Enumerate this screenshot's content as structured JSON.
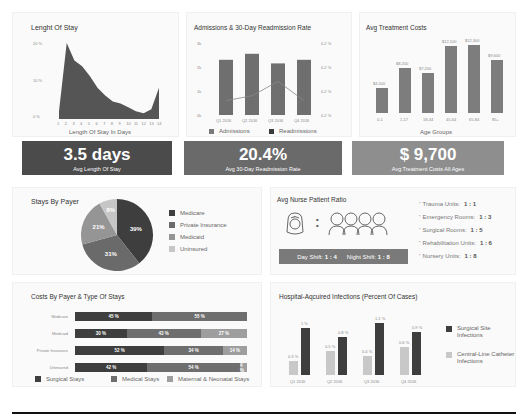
{
  "colors": {
    "dark": "#4a4a4a",
    "mid": "#6e6e6e",
    "light": "#9a9a9a",
    "lighter": "#c4c4c4",
    "bar": "#7d7d7d"
  },
  "length_of_stay": {
    "title": "Lenght Of Stay",
    "xlabel": "Length Of Stay In Days",
    "yticks": [
      "20 %",
      "10 %",
      "0 %"
    ],
    "xticks": [
      "1",
      "2",
      "3",
      "4",
      "5",
      "6",
      "7",
      "8",
      "9",
      "10",
      "11",
      "12",
      "13",
      "14"
    ]
  },
  "admissions": {
    "title": "Admissions & 30-Day Readmission Rate",
    "yticks_left": [
      "3k",
      "2k",
      "1k",
      "0k"
    ],
    "yticks_right": [
      "0.2 %",
      "0.2 %",
      "0.2 %",
      "0.2 %"
    ],
    "xticks": [
      "Q1 2016",
      "Q2 2016",
      "Q3 2016",
      "Q4 2016"
    ],
    "legend": [
      "Admissions",
      "Readmissions"
    ]
  },
  "treatment_costs": {
    "title": "Avg Treatment Costs",
    "xlabel": "Age Groups",
    "labels": [
      "$4,500",
      "$8,200",
      "$7,200",
      "$12,100",
      "$12,300",
      "$9,600"
    ],
    "xticks": [
      "0-1",
      "1-17",
      "18-44",
      "45-64",
      "65-84",
      "85+"
    ]
  },
  "kpis": [
    {
      "value": "3.5 days",
      "label": "Avg Length Of Stay",
      "color": "#4b4b4b"
    },
    {
      "value": "20.4%",
      "label": "Avg 30-Day Readmission Rate",
      "color": "#6a6a6a"
    },
    {
      "value": "$ 9,700",
      "label": "Avg Treatment Costs All Ages",
      "color": "#8e8e8e"
    }
  ],
  "stays_by_payer": {
    "title": "Stays By Payer",
    "slices": [
      {
        "label": "Medicare",
        "pct": "39%"
      },
      {
        "label": "Private Insurance",
        "pct": "31%"
      },
      {
        "label": "Medicaid",
        "pct": "21%"
      },
      {
        "label": "Uninsured",
        "pct": "8%"
      }
    ]
  },
  "nurse_ratio": {
    "title": "Avg Nurse Patient Ratio",
    "colon": ":",
    "day_shift_label": "Day Shift:",
    "day_shift_value": "1 : 4",
    "night_shift_label": "Night Shift:",
    "night_shift_value": "1 : 8",
    "units": [
      {
        "label": "Trauma Units:",
        "value": "1 : 1"
      },
      {
        "label": "Emergency Rooms:",
        "value": "1 : 3"
      },
      {
        "label": "Surgical Rooms:",
        "value": "1 : 5"
      },
      {
        "label": "Rehabilitation Units:",
        "value": "1 : 6"
      },
      {
        "label": "Nursery Units:",
        "value": "1 : 8"
      }
    ]
  },
  "costs_by_payer": {
    "title": "Costs By Payer & Type Of Stays",
    "rows": [
      {
        "label": "Medicare",
        "segments": [
          "45 %",
          "55 %"
        ]
      },
      {
        "label": "Medicaid",
        "segments": [
          "30 %",
          "43 %",
          "27 %"
        ]
      },
      {
        "label": "Private Insurance",
        "segments": [
          "52 %",
          "34 %",
          "14 %"
        ]
      },
      {
        "label": "Uninsured",
        "segments": [
          "42 %",
          "54 %",
          "4 %"
        ]
      }
    ],
    "legend": [
      "Surgical Stays",
      "Medical Stays",
      "Maternal & Neonatal Stays"
    ]
  },
  "infections": {
    "title": "Hospital-Aqcuired Infections (Percent Of Cases)",
    "xticks": [
      "Q1 2016",
      "Q2 2016",
      "Q3 2016",
      "Q4 2016"
    ],
    "central_line_labels": [
      "0.3 %",
      "0.5 %",
      "0.4 %",
      "0.6 %"
    ],
    "surgical_labels": [
      "1 %",
      "0.8 %",
      "1.1 %",
      "0.9 %"
    ],
    "legend": [
      "Surgical Site Infections",
      "Central-Line Catheter Infections"
    ]
  },
  "chart_data": [
    {
      "type": "area",
      "title": "Lenght Of Stay",
      "xlabel": "Length Of Stay In Days",
      "ylabel": "",
      "x": [
        1,
        2,
        3,
        4,
        5,
        6,
        7,
        8,
        9,
        10,
        11,
        12,
        13,
        14
      ],
      "values": [
        2,
        19.5,
        15,
        13.5,
        11,
        8,
        6,
        4.5,
        4,
        3,
        2,
        1.5,
        2.5,
        8
      ],
      "ylim": [
        0,
        20
      ],
      "yticks": [
        "0 %",
        "10 %",
        "20 %"
      ]
    },
    {
      "type": "bar",
      "title": "Admissions & 30-Day Readmission Rate",
      "categories": [
        "Q1 2016",
        "Q2 2016",
        "Q3 2016",
        "Q4 2016"
      ],
      "series": [
        {
          "name": "Admissions",
          "type": "bar",
          "values": [
            2300,
            2550,
            2150,
            2300
          ]
        },
        {
          "name": "Readmissions",
          "type": "line",
          "values": [
            0.196,
            0.198,
            0.204,
            0.196
          ]
        }
      ],
      "ylim": [
        0,
        3000
      ],
      "yticks_left": [
        "0k",
        "1k",
        "2k",
        "3k"
      ],
      "yticks_right": [
        "0.2 %",
        "0.2 %",
        "0.2 %",
        "0.2 %"
      ]
    },
    {
      "type": "bar",
      "title": "Avg Treatment Costs",
      "xlabel": "Age Groups",
      "categories": [
        "0-1",
        "1-17",
        "18-44",
        "45-64",
        "65-84",
        "85+"
      ],
      "values": [
        4500,
        8200,
        7200,
        12100,
        12300,
        9600
      ],
      "ylim": [
        0,
        13000
      ]
    },
    {
      "type": "pie",
      "title": "Stays By Payer",
      "categories": [
        "Medicare",
        "Private Insurance",
        "Medicaid",
        "Uninsured"
      ],
      "values": [
        39,
        31,
        21,
        8
      ]
    },
    {
      "type": "bar",
      "orientation": "horizontal-stacked",
      "title": "Costs By Payer & Type Of Stays",
      "categories": [
        "Medicare",
        "Medicaid",
        "Private Insurance",
        "Uninsured"
      ],
      "series": [
        {
          "name": "Surgical Stays",
          "values": [
            45,
            30,
            52,
            42
          ]
        },
        {
          "name": "Medical Stays",
          "values": [
            55,
            43,
            34,
            54
          ]
        },
        {
          "name": "Maternal & Neonatal Stays",
          "values": [
            0,
            27,
            14,
            4
          ]
        }
      ]
    },
    {
      "type": "bar",
      "title": "Hospital-Aqcuired Infections (Percent Of Cases)",
      "categories": [
        "Q1 2016",
        "Q2 2016",
        "Q3 2016",
        "Q4 2016"
      ],
      "series": [
        {
          "name": "Central-Line Catheter Infections",
          "values": [
            0.3,
            0.5,
            0.4,
            0.6
          ]
        },
        {
          "name": "Surgical Site Infections",
          "values": [
            1.0,
            0.8,
            1.1,
            0.9
          ]
        }
      ],
      "legend_position": "right"
    }
  ]
}
